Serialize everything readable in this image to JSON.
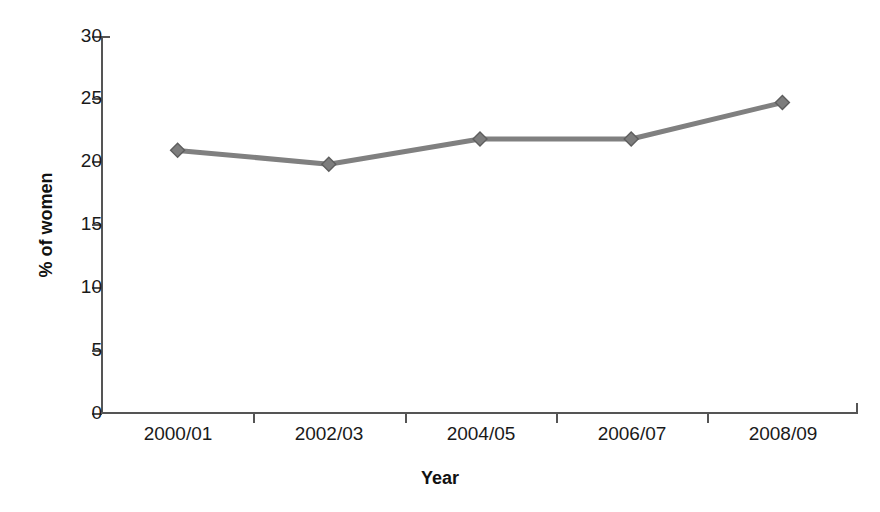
{
  "chart_data": {
    "type": "line",
    "title": "",
    "xlabel": "Year",
    "ylabel": "% of women",
    "categories": [
      "2000/01",
      "2002/03",
      "2004/05",
      "2006/07",
      "2008/09"
    ],
    "values": [
      20.9,
      19.8,
      21.8,
      21.8,
      24.7
    ],
    "series": [
      {
        "name": "% of women",
        "values": [
          20.9,
          19.8,
          21.8,
          21.8,
          24.7
        ],
        "color": "#808080",
        "marker": "diamond"
      }
    ],
    "ylim": [
      0,
      30
    ],
    "yticks": [
      0,
      5,
      10,
      15,
      20,
      25,
      30
    ],
    "ytick_labels": [
      "0",
      "5",
      "10",
      "15",
      "20",
      "25",
      "30"
    ],
    "grid": false,
    "legend": null,
    "legend_position": "none"
  },
  "axis": {
    "y_title": "% of women",
    "x_title": "Year",
    "y_tick_labels": [
      "30",
      "25",
      "20",
      "15",
      "10",
      "5",
      "0"
    ],
    "x_tick_labels": [
      "2000/01",
      "2002/03",
      "2004/05",
      "2006/07",
      "2008/09"
    ]
  },
  "style": {
    "line_color": "#808080",
    "marker_color": "#7d7d7d",
    "marker_edge_color": "#5e5e5e",
    "axis_color": "#555555",
    "text_color": "#1a1a1a",
    "background": "#ffffff"
  }
}
